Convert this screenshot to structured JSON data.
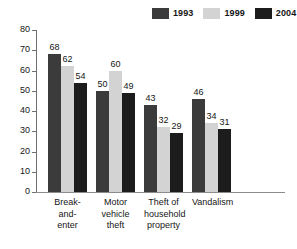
{
  "chart_data": {
    "type": "bar",
    "title": "",
    "subtitle": "",
    "xlabel": "",
    "ylabel": "",
    "ylim": [
      0,
      80
    ],
    "yticks": [
      0,
      10,
      20,
      30,
      40,
      50,
      60,
      70,
      80
    ],
    "grid": false,
    "legend_position": "top-right",
    "categories": [
      "Break-and-\nenter",
      "Motor\nvehicle theft",
      "Theft of\nhousehold\nproperty",
      "Vandalism"
    ],
    "category_lines": [
      [
        "Break-and-",
        "enter"
      ],
      [
        "Motor",
        "vehicle theft"
      ],
      [
        "Theft of",
        "household",
        "property"
      ],
      [
        "Vandalism"
      ]
    ],
    "series": [
      {
        "name": "1993",
        "color": "#3b3b3b",
        "values": [
          68,
          50,
          43,
          46
        ]
      },
      {
        "name": "1999",
        "color": "#d3d3d3",
        "values": [
          62,
          60,
          32,
          34
        ]
      },
      {
        "name": "2004",
        "color": "#1c1c1c",
        "values": [
          54,
          49,
          29,
          31
        ]
      }
    ]
  },
  "legend": {
    "items": [
      {
        "label": "1993",
        "color": "#3b3b3b"
      },
      {
        "label": "1999",
        "color": "#d3d3d3"
      },
      {
        "label": "2004",
        "color": "#1c1c1c"
      }
    ]
  },
  "axis": {
    "y_tick_labels": [
      "80",
      "70",
      "60",
      "50",
      "40",
      "30",
      "20",
      "10",
      "0"
    ]
  }
}
